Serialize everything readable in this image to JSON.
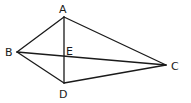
{
  "diagram": {
    "points": {
      "A": {
        "label": "A",
        "x": 64,
        "y": 17,
        "lx": 62,
        "ly": 14
      },
      "B": {
        "label": "B",
        "x": 17,
        "y": 52,
        "lx": 6,
        "ly": 56
      },
      "C": {
        "label": "C",
        "x": 166,
        "y": 65,
        "lx": 171,
        "ly": 70
      },
      "D": {
        "label": "D",
        "x": 64,
        "y": 83,
        "lx": 59,
        "ly": 98
      },
      "E": {
        "label": "E",
        "x": 64,
        "y": 56,
        "lx": 66,
        "ly": 55
      }
    },
    "segments": [
      [
        "A",
        "B"
      ],
      [
        "A",
        "C"
      ],
      [
        "A",
        "D"
      ],
      [
        "B",
        "C"
      ],
      [
        "B",
        "D"
      ],
      [
        "D",
        "C"
      ]
    ]
  }
}
